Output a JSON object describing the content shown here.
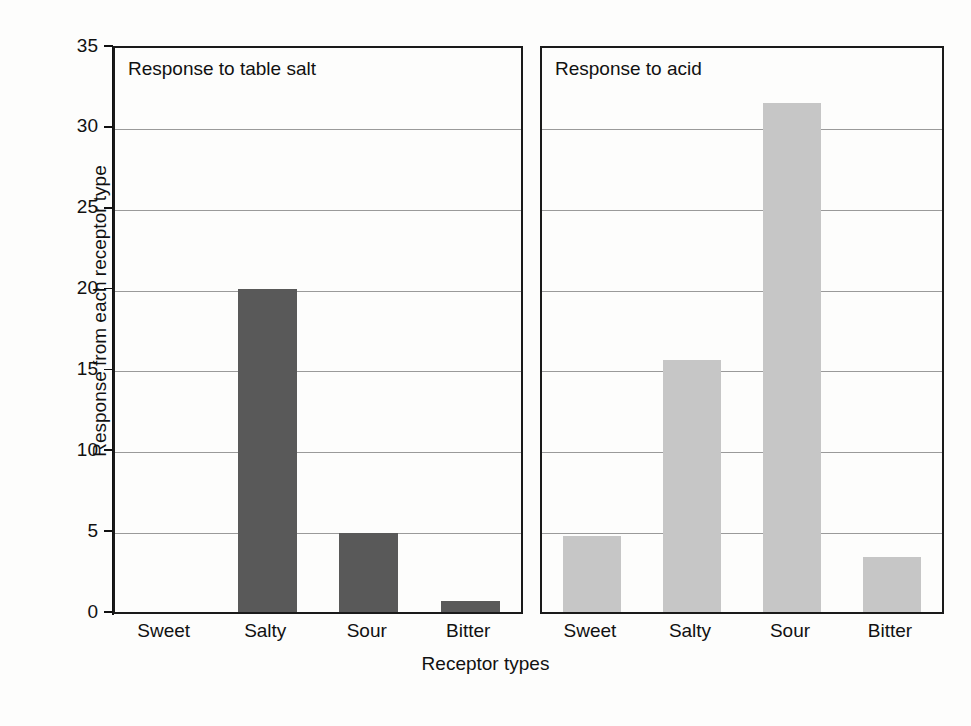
{
  "figure": {
    "ylabel": "Response from each receptor type",
    "xlabel": "Receptor types",
    "panels": [
      {
        "title": "Response to table salt"
      },
      {
        "title": "Response to acid"
      }
    ],
    "yticks": [
      "0",
      "5",
      "10",
      "15",
      "20",
      "25",
      "30",
      "35"
    ],
    "categories": [
      "Sweet",
      "Salty",
      "Sour",
      "Bitter"
    ],
    "colors": {
      "bar_dark": "#595959",
      "bar_light": "#c6c6c6",
      "axis": "#1a1a1a",
      "gridline": "#9a9a9a"
    }
  },
  "chart_data": {
    "type": "bar",
    "title": "",
    "xlabel": "Receptor types",
    "ylabel": "Response from each receptor type",
    "ylim": [
      0,
      35
    ],
    "yticks": [
      0,
      5,
      10,
      15,
      20,
      25,
      30,
      35
    ],
    "grid": true,
    "legend": "none",
    "categories": [
      "Sweet",
      "Salty",
      "Sour",
      "Bitter"
    ],
    "panels": [
      {
        "title": "Response to table salt",
        "color": "#595959",
        "values": [
          0,
          20,
          4.9,
          0.7
        ]
      },
      {
        "title": "Response to acid",
        "color": "#c6c6c6",
        "values": [
          4.7,
          15.6,
          31.5,
          3.4
        ]
      }
    ]
  }
}
